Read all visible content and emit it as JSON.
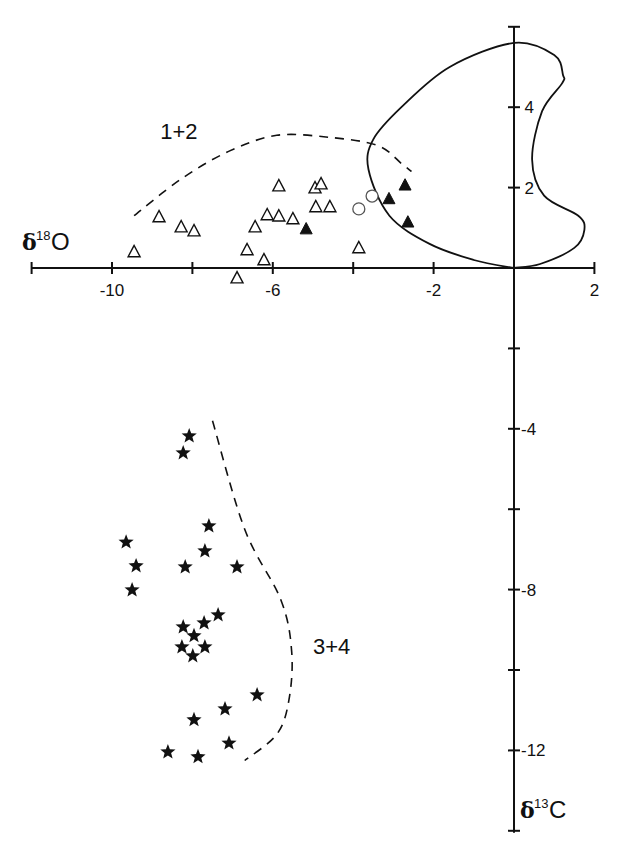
{
  "chart_data": {
    "type": "scatter",
    "title": "",
    "xlabel": "δ18O",
    "ylabel": "δ13C",
    "axes": {
      "x": {
        "label_symbol": "δ",
        "label_sup": "18",
        "label_element": "O",
        "range": [
          -12,
          2
        ],
        "ticks": [
          -12,
          -10,
          -8,
          -6,
          -4,
          -2,
          0,
          2
        ],
        "tick_labels": [
          "-10",
          "-6",
          "-2",
          "2"
        ],
        "labeled_ticks": [
          -10,
          -6,
          -2,
          2
        ]
      },
      "y": {
        "label_symbol": "δ",
        "label_sup": "13",
        "label_element": "C",
        "range": [
          -14,
          6
        ],
        "ticks": [
          -14,
          -12,
          -10,
          -8,
          -6,
          -4,
          -2,
          0,
          2,
          4,
          6
        ],
        "tick_labels": [
          "4",
          "2",
          "-4",
          "-8",
          "-12"
        ],
        "labeled_ticks": [
          4,
          2,
          -4,
          -8,
          -12
        ]
      },
      "origin_crossing": true,
      "grid": false
    },
    "group_labels": [
      {
        "text": "1+2",
        "x": -8.8,
        "y": 3.2
      },
      {
        "text": "3+4",
        "x": -5.0,
        "y": -9.6
      }
    ],
    "series": [
      {
        "name": "open triangles",
        "marker": "open-triangle",
        "points": [
          [
            -9.45,
            0.4
          ],
          [
            -8.83,
            1.27
          ],
          [
            -8.28,
            1.02
          ],
          [
            -7.96,
            0.92
          ],
          [
            -6.89,
            -0.25
          ],
          [
            -6.64,
            0.45
          ],
          [
            -6.44,
            1.02
          ],
          [
            -6.22,
            0.2
          ],
          [
            -6.14,
            1.32
          ],
          [
            -5.85,
            1.29
          ],
          [
            -5.85,
            2.04
          ],
          [
            -5.5,
            1.22
          ],
          [
            -4.95,
            1.99
          ],
          [
            -4.8,
            2.09
          ],
          [
            -4.93,
            1.52
          ],
          [
            -4.58,
            1.52
          ],
          [
            -3.86,
            0.5
          ]
        ]
      },
      {
        "name": "filled triangles",
        "marker": "filled-triangle",
        "points": [
          [
            -5.17,
            0.97
          ],
          [
            -3.11,
            1.72
          ],
          [
            -2.71,
            2.06
          ],
          [
            -2.64,
            1.14
          ]
        ]
      },
      {
        "name": "open circles",
        "marker": "open-circle",
        "points": [
          [
            -3.86,
            1.47
          ],
          [
            -3.53,
            1.79
          ]
        ]
      },
      {
        "name": "stars",
        "marker": "star",
        "points": [
          [
            -8.08,
            -4.18
          ],
          [
            -8.23,
            -4.6
          ],
          [
            -7.59,
            -6.42
          ],
          [
            -7.69,
            -7.04
          ],
          [
            -9.65,
            -6.82
          ],
          [
            -9.4,
            -7.41
          ],
          [
            -8.18,
            -7.44
          ],
          [
            -6.89,
            -7.44
          ],
          [
            -9.5,
            -8.01
          ],
          [
            -7.36,
            -8.63
          ],
          [
            -7.71,
            -8.83
          ],
          [
            -8.23,
            -8.93
          ],
          [
            -7.96,
            -9.15
          ],
          [
            -8.26,
            -9.43
          ],
          [
            -7.69,
            -9.43
          ],
          [
            -7.99,
            -9.65
          ],
          [
            -6.39,
            -10.62
          ],
          [
            -7.19,
            -10.97
          ],
          [
            -7.96,
            -11.24
          ],
          [
            -7.09,
            -11.82
          ],
          [
            -8.61,
            -12.04
          ],
          [
            -7.86,
            -12.16
          ]
        ]
      }
    ],
    "curves": [
      {
        "name": "solid envelope",
        "style": "solid",
        "points": [
          [
            0,
            0
          ],
          [
            -1.0,
            0.2
          ],
          [
            -2.1,
            0.6
          ],
          [
            -3.1,
            1.3
          ],
          [
            -3.62,
            2.45
          ],
          [
            -3.5,
            3.2
          ],
          [
            -2.8,
            4.0
          ],
          [
            -1.6,
            5.0
          ],
          [
            0,
            5.6
          ],
          [
            1.0,
            5.3
          ],
          [
            1.22,
            4.8
          ],
          [
            1.2,
            4.6
          ],
          [
            0.7,
            3.9
          ],
          [
            0.45,
            2.7
          ],
          [
            0.75,
            1.8
          ],
          [
            1.6,
            1.3
          ],
          [
            1.75,
            0.95
          ],
          [
            1.5,
            0.5
          ],
          [
            0.65,
            0.1
          ],
          [
            0,
            0
          ]
        ]
      },
      {
        "name": "dashed boundary 1+2",
        "style": "dashed",
        "points": [
          [
            -9.45,
            1.3
          ],
          [
            -8.3,
            2.2
          ],
          [
            -7.1,
            2.9
          ],
          [
            -5.9,
            3.3
          ],
          [
            -4.6,
            3.25
          ],
          [
            -3.4,
            3.05
          ],
          [
            -2.8,
            2.6
          ],
          [
            -2.55,
            2.4
          ]
        ]
      },
      {
        "name": "dashed boundary 3+4",
        "style": "dashed",
        "points": [
          [
            -7.5,
            -3.8
          ],
          [
            -6.7,
            -6.5
          ],
          [
            -5.8,
            -8.25
          ],
          [
            -5.53,
            -9.55
          ],
          [
            -5.6,
            -10.75
          ],
          [
            -5.9,
            -11.6
          ],
          [
            -6.7,
            -12.25
          ]
        ]
      }
    ]
  }
}
